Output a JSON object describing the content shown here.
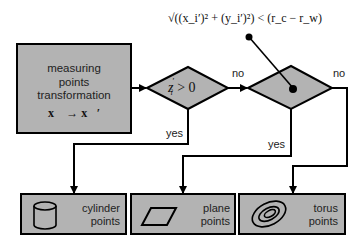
{
  "diagram": {
    "type": "flowchart",
    "colors": {
      "box_fill": "#b3b3b3",
      "stroke": "#000000",
      "background": "#ffffff",
      "text": "#222222"
    },
    "start_box": {
      "lines": [
        "measuring",
        "points",
        "transformation"
      ],
      "formula": "x⃗ → x⃗′"
    },
    "decision_1": {
      "condition": "z_i′ > 0",
      "cond_main": "z",
      "cond_sub": "i",
      "cond_prime": "′",
      "cond_rest": " > 0"
    },
    "decision_2": {
      "condition": "√((x_i′)² + (y_i′)²) < (r_c − r_w)"
    },
    "formula_text": "√((x_i′)² + (y_i′)²) < (r_c − r_w)",
    "edges": {
      "d1_no": "no",
      "d1_yes": "yes",
      "d2_no": "no",
      "d2_yes": "yes"
    },
    "outputs": [
      {
        "icon": "cylinder-icon",
        "line1": "cylinder",
        "line2": "points"
      },
      {
        "icon": "parallelogram-icon",
        "line1": "plane",
        "line2": "points"
      },
      {
        "icon": "torus-icon",
        "line1": "torus",
        "line2": "points"
      }
    ]
  }
}
